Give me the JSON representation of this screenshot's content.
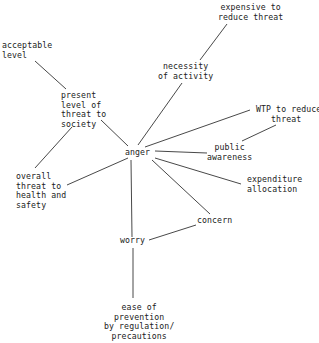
{
  "diagram": {
    "type": "concept-map",
    "center_node": "anger",
    "nodes": {
      "expensive": "expensive to\nreduce threat",
      "necessity": "necessity\nof activity",
      "acceptable": "acceptable\nlevel",
      "present": "present\nlevel of\nthreat to\nsociety",
      "wtp": "WTP to reduce\n   threat",
      "anger": "anger",
      "public": "public\nawareness",
      "overall": "overall\nthreat to\nhealth and\nsafety",
      "expenditure": "expenditure\nallocation",
      "concern": "concern",
      "worry": "worry",
      "ease": "ease of\nprevention\nby regulation/\nprecautions"
    },
    "edges": [
      [
        "anger",
        "necessity of activity"
      ],
      [
        "necessity of activity",
        "expensive to reduce threat"
      ],
      [
        "anger",
        "present level of threat to society"
      ],
      [
        "present level of threat to society",
        "acceptable level"
      ],
      [
        "present level of threat to society",
        "overall threat to health and safety"
      ],
      [
        "anger",
        "WTP to reduce threat"
      ],
      [
        "public awareness",
        "WTP to reduce threat"
      ],
      [
        "anger",
        "public awareness"
      ],
      [
        "anger",
        "expenditure allocation"
      ],
      [
        "anger",
        "concern"
      ],
      [
        "anger",
        "overall threat to health and safety"
      ],
      [
        "anger",
        "worry"
      ],
      [
        "worry",
        "concern"
      ],
      [
        "worry",
        "ease of prevention by regulation/precautions"
      ]
    ]
  }
}
